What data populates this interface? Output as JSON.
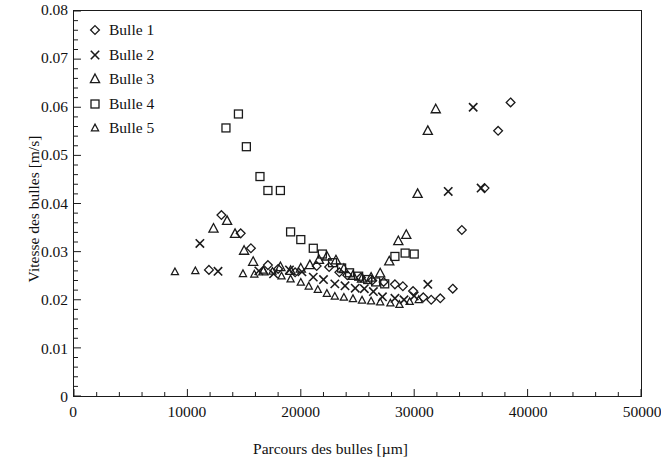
{
  "chart_data": {
    "type": "scatter",
    "title": "",
    "xlabel": "Parcours des bulles [µm]",
    "ylabel": "Vitesse des bulles [m/s]",
    "xlim": [
      0,
      50000
    ],
    "ylim": [
      0,
      0.08
    ],
    "xticks": [
      0,
      10000,
      20000,
      30000,
      40000,
      50000
    ],
    "xtick_labels": [
      "0",
      "10000",
      "20000",
      "30000",
      "40000",
      "50000"
    ],
    "yticks": [
      0,
      0.01,
      0.02,
      0.03,
      0.04,
      0.05,
      0.06,
      0.07,
      0.08
    ],
    "ytick_labels": [
      "0",
      "0.01",
      "0.02",
      "0.03",
      "0.04",
      "0.05",
      "0.06",
      "0.07",
      "0.08"
    ],
    "x_minor_tick_interval": 2000,
    "y_minor_tick_interval": 0.002,
    "grid": false,
    "legend_position": "upper left inside",
    "series": [
      {
        "name": "Bulle 1",
        "marker": "diamond",
        "color": "#1a1a1a",
        "points": [
          [
            11900,
            0.0262
          ],
          [
            13000,
            0.0376
          ],
          [
            14700,
            0.0338
          ],
          [
            15600,
            0.0307
          ],
          [
            17100,
            0.0272
          ],
          [
            18000,
            0.0264
          ],
          [
            19500,
            0.0257
          ],
          [
            21400,
            0.027
          ],
          [
            22500,
            0.0268
          ],
          [
            23400,
            0.0257
          ],
          [
            24100,
            0.0251
          ],
          [
            25300,
            0.0246
          ],
          [
            26300,
            0.024
          ],
          [
            27300,
            0.0237
          ],
          [
            28300,
            0.0232
          ],
          [
            29000,
            0.0228
          ],
          [
            29900,
            0.0218
          ],
          [
            30800,
            0.0205
          ],
          [
            31500,
            0.02
          ],
          [
            32300,
            0.0203
          ],
          [
            33400,
            0.0223
          ],
          [
            34200,
            0.0345
          ],
          [
            36200,
            0.0432
          ],
          [
            37400,
            0.0551
          ],
          [
            38500,
            0.061
          ]
        ]
      },
      {
        "name": "Bulle 2",
        "marker": "cross",
        "color": "#1a1a1a",
        "points": [
          [
            11100,
            0.0317
          ],
          [
            12700,
            0.0259
          ],
          [
            16300,
            0.026
          ],
          [
            17600,
            0.0254
          ],
          [
            19000,
            0.0262
          ],
          [
            20100,
            0.0258
          ],
          [
            21100,
            0.0247
          ],
          [
            22000,
            0.0242
          ],
          [
            23000,
            0.0233
          ],
          [
            23900,
            0.0229
          ],
          [
            24800,
            0.0224
          ],
          [
            25600,
            0.0223
          ],
          [
            26400,
            0.0217
          ],
          [
            27200,
            0.0206
          ],
          [
            28300,
            0.0203
          ],
          [
            29100,
            0.02
          ],
          [
            30000,
            0.0208
          ],
          [
            31200,
            0.0232
          ],
          [
            33000,
            0.0425
          ],
          [
            35200,
            0.06
          ],
          [
            35900,
            0.0432
          ]
        ]
      },
      {
        "name": "Bulle 3",
        "marker": "triangle",
        "color": "#1a1a1a",
        "points": [
          [
            12300,
            0.0348
          ],
          [
            13500,
            0.0364
          ],
          [
            14200,
            0.0337
          ],
          [
            15000,
            0.0302
          ],
          [
            15800,
            0.0279
          ],
          [
            16700,
            0.0259
          ],
          [
            18200,
            0.0268
          ],
          [
            19100,
            0.026
          ],
          [
            20000,
            0.0265
          ],
          [
            20800,
            0.0272
          ],
          [
            21600,
            0.0283
          ],
          [
            22300,
            0.029
          ],
          [
            23100,
            0.0282
          ],
          [
            23800,
            0.0264
          ],
          [
            24600,
            0.025
          ],
          [
            25400,
            0.0244
          ],
          [
            26200,
            0.0246
          ],
          [
            27000,
            0.0255
          ],
          [
            27800,
            0.028
          ],
          [
            28600,
            0.0322
          ],
          [
            29300,
            0.0335
          ],
          [
            30300,
            0.042
          ],
          [
            31200,
            0.0551
          ],
          [
            31900,
            0.0596
          ]
        ]
      },
      {
        "name": "Bulle 4",
        "marker": "square",
        "color": "#1a1a1a",
        "points": [
          [
            13400,
            0.0557
          ],
          [
            14500,
            0.0586
          ],
          [
            15200,
            0.0518
          ],
          [
            16400,
            0.0456
          ],
          [
            17100,
            0.0427
          ],
          [
            18200,
            0.0427
          ],
          [
            19100,
            0.0341
          ],
          [
            20000,
            0.0325
          ],
          [
            21100,
            0.0307
          ],
          [
            21900,
            0.0295
          ],
          [
            22800,
            0.0277
          ],
          [
            23600,
            0.0266
          ],
          [
            24300,
            0.0256
          ],
          [
            25100,
            0.0249
          ],
          [
            25900,
            0.0242
          ],
          [
            26600,
            0.0237
          ],
          [
            27400,
            0.0233
          ],
          [
            28300,
            0.029
          ],
          [
            29200,
            0.0297
          ],
          [
            30000,
            0.0295
          ]
        ]
      },
      {
        "name": "Bulle 5",
        "marker": "triangle-small",
        "color": "#1a1a1a",
        "points": [
          [
            8900,
            0.0258
          ],
          [
            10700,
            0.026
          ],
          [
            14900,
            0.0254
          ],
          [
            15900,
            0.0253
          ],
          [
            16700,
            0.0261
          ],
          [
            17500,
            0.0259
          ],
          [
            18300,
            0.0249
          ],
          [
            19100,
            0.0243
          ],
          [
            20000,
            0.0236
          ],
          [
            20700,
            0.0228
          ],
          [
            21500,
            0.0221
          ],
          [
            22300,
            0.0213
          ],
          [
            23000,
            0.0207
          ],
          [
            23800,
            0.0205
          ],
          [
            24600,
            0.0202
          ],
          [
            25400,
            0.0199
          ],
          [
            26200,
            0.0197
          ],
          [
            27000,
            0.0195
          ],
          [
            27900,
            0.0193
          ],
          [
            28700,
            0.019
          ],
          [
            29600,
            0.0196
          ],
          [
            30400,
            0.02
          ]
        ]
      }
    ]
  },
  "legend": {
    "items": [
      {
        "label": "Bulle 1",
        "marker": "diamond"
      },
      {
        "label": "Bulle 2",
        "marker": "cross"
      },
      {
        "label": "Bulle 3",
        "marker": "triangle"
      },
      {
        "label": "Bulle 4",
        "marker": "square"
      },
      {
        "label": "Bulle 5",
        "marker": "triangle-small"
      }
    ]
  }
}
